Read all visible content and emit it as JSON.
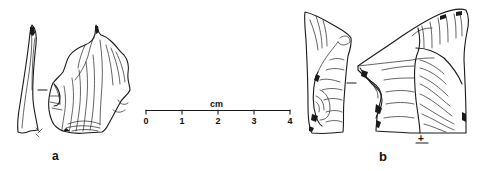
{
  "figure": {
    "artifacts": [
      {
        "id": "a",
        "label": "a",
        "description": "flake, lateral and dorsal views"
      },
      {
        "id": "b",
        "label": "b",
        "description": "flake, lateral and dorsal views"
      }
    ],
    "scale_bar": {
      "unit": "cm",
      "ticks": [
        "0",
        "1",
        "2",
        "3",
        "4"
      ]
    },
    "symbols": {
      "percussion_mark": "+"
    }
  }
}
